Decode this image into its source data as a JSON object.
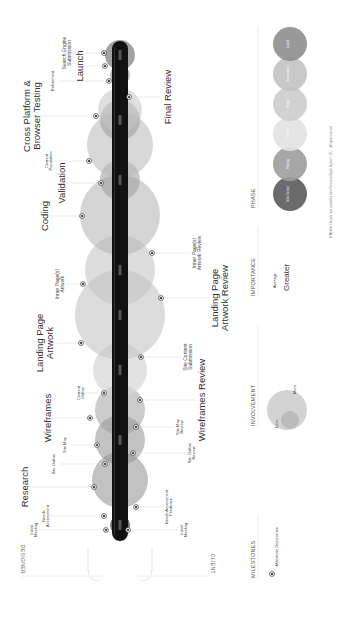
{
  "diagram": {
    "roles": {
      "designer": "DESIGNER",
      "client": "CLIENT"
    },
    "phase_nodes": [
      {
        "id": "initial-contact",
        "cx": 101,
        "r": 10,
        "color": "#5a5a5a",
        "opacity": 0.85
      },
      {
        "id": "research",
        "cx": 146,
        "r": 28,
        "color": "#8f8f8f",
        "opacity": 0.55
      },
      {
        "id": "site-structure",
        "cx": 186,
        "r": 25,
        "color": "#8f8f8f",
        "opacity": 0.55
      },
      {
        "id": "wireframes",
        "cx": 216,
        "r": 25,
        "color": "#9a9a9a",
        "opacity": 0.5
      },
      {
        "id": "content-outline",
        "cx": 256,
        "r": 27,
        "color": "#d6d6d6",
        "opacity": 0.7
      },
      {
        "id": "landing-page-artwork",
        "cx": 311,
        "r": 45,
        "color": "#c4c4c4",
        "opacity": 0.6
      },
      {
        "id": "inner-pages",
        "cx": 356,
        "r": 35,
        "color": "#c4c4c4",
        "opacity": 0.6
      },
      {
        "id": "coding",
        "cx": 411,
        "r": 40,
        "color": "#b8b8b8",
        "opacity": 0.6
      },
      {
        "id": "validation",
        "cx": 446,
        "r": 20,
        "color": "#9a9a9a",
        "opacity": 0.55
      },
      {
        "id": "content-population",
        "cx": 481,
        "r": 33,
        "color": "#bdbdbd",
        "opacity": 0.6
      },
      {
        "id": "cross-platform",
        "cx": 506,
        "r": 20,
        "color": "#9a9a9a",
        "opacity": 0.55
      },
      {
        "id": "final-review",
        "cx": 516,
        "r": 22,
        "color": "#c4c4c4",
        "opacity": 0.55
      },
      {
        "id": "refinement",
        "cx": 551,
        "r": 10,
        "color": "#8a8a8a",
        "opacity": 0.6
      },
      {
        "id": "launch",
        "cx": 571,
        "r": 15,
        "color": "#7a7a7a",
        "opacity": 0.7
      }
    ],
    "bar": {
      "x1": 85,
      "x2": 585,
      "color": "#111111",
      "ticks": [
        "",
        "",
        "",
        "",
        "",
        "",
        ""
      ]
    },
    "designer_milestones": [
      {
        "label": "Initial Meeting",
        "size": "small",
        "dot_x": 96,
        "dot_y": 106,
        "lx": 96,
        "ly": 30
      },
      {
        "label": "Needs Assessment",
        "size": "small",
        "dot_x": 110,
        "dot_y": 104,
        "lx": 110,
        "ly": 42
      },
      {
        "label": "Research",
        "size": "big",
        "dot_x": 139,
        "dot_y": 94,
        "lx": 139,
        "ly": 20
      },
      {
        "label": "Site Outline",
        "size": "small",
        "dot_x": 162,
        "dot_y": 105,
        "lx": 162,
        "ly": 52
      },
      {
        "label": "Site Map",
        "size": "small",
        "dot_x": 181,
        "dot_y": 97,
        "lx": 181,
        "ly": 63
      },
      {
        "label": "Wireframes",
        "size": "big",
        "dot_x": 208,
        "dot_y": 90,
        "lx": 208,
        "ly": 43
      },
      {
        "label": "Content Outline",
        "size": "small",
        "dot_x": 233,
        "dot_y": 104,
        "lx": 233,
        "ly": 77
      },
      {
        "label": "Landing Page Artwork",
        "size": "big",
        "dot_x": 283,
        "dot_y": 81,
        "lx": 283,
        "ly": 35
      },
      {
        "label": "Inner Page(s) Artwork",
        "size": "mid",
        "dot_x": 342,
        "dot_y": 83,
        "lx": 342,
        "ly": 55
      },
      {
        "label": "Coding",
        "size": "big",
        "dot_x": 410,
        "dot_y": 82,
        "lx": 410,
        "ly": 40
      },
      {
        "label": "Validation",
        "size": "big",
        "dot_x": 443,
        "dot_y": 101,
        "lx": 443,
        "ly": 57
      },
      {
        "label": "Content Population",
        "size": "small",
        "dot_x": 465,
        "dot_y": 89,
        "lx": 465,
        "ly": 45
      },
      {
        "label": "Cross Platform & Browser Testing",
        "size": "big",
        "dot_x": 510,
        "dot_y": 96,
        "lx": 510,
        "ly": 22
      },
      {
        "label": "Refinement",
        "size": "small",
        "dot_x": 545,
        "dot_y": 109,
        "lx": 545,
        "ly": 51
      },
      {
        "label": "Launch",
        "size": "big",
        "dot_x": 560,
        "dot_y": 105,
        "lx": 560,
        "ly": 75
      },
      {
        "label": "Search Engine Submission",
        "size": "mid",
        "dot_x": 573,
        "dot_y": 104,
        "lx": 573,
        "ly": 62
      }
    ],
    "client_milestones": [
      {
        "label": "Initial Meeting",
        "size": "small",
        "dot_x": 96,
        "dot_y": 128,
        "lx": 96,
        "ly": 180
      },
      {
        "label": "Needs Assessment Feedback",
        "size": "small",
        "dot_x": 119,
        "dot_y": 136,
        "lx": 119,
        "ly": 165
      },
      {
        "label": "Site Outline Review",
        "size": "small",
        "dot_x": 173,
        "dot_y": 133,
        "lx": 173,
        "ly": 188
      },
      {
        "label": "Site Map Review",
        "size": "small",
        "dot_x": 199,
        "dot_y": 136,
        "lx": 199,
        "ly": 176
      },
      {
        "label": "Wireframes Review",
        "size": "big",
        "dot_x": 226,
        "dot_y": 140,
        "lx": 226,
        "ly": 197
      },
      {
        "label": "Site Content Submission",
        "size": "mid",
        "dot_x": 269,
        "dot_y": 141,
        "lx": 269,
        "ly": 183
      },
      {
        "label": "Landing Page Artwork Review",
        "size": "big",
        "dot_x": 328,
        "dot_y": 161,
        "lx": 328,
        "ly": 210
      },
      {
        "label": "Inner Page(s) Artwork Review",
        "size": "mid",
        "dot_x": 373,
        "dot_y": 152,
        "lx": 373,
        "ly": 192
      },
      {
        "label": "Final Review",
        "size": "big",
        "dot_x": 529,
        "dot_y": 129,
        "lx": 529,
        "ly": 163
      }
    ]
  },
  "legend": {
    "milestones": {
      "title": "MILESTONES",
      "item": "Milestone Occurrence"
    },
    "involvement": {
      "title": "INVOLVEMENT",
      "less": "Less",
      "more": "More"
    },
    "importance": {
      "title": "IMPORTANCE",
      "average": "Average",
      "greater": "Greater"
    },
    "phase": {
      "title": "PHASE",
      "items": [
        {
          "label": "Initial Contact",
          "color": "#5b5b5b"
        },
        {
          "label": "Planning",
          "color": "#9d9d9d"
        },
        {
          "label": "Content",
          "color": "#e2e2e2"
        },
        {
          "label": "Design",
          "color": "#cdcdcd"
        },
        {
          "label": "Development",
          "color": "#c2c2c2"
        },
        {
          "label": "Launch",
          "color": "#8e8e8e"
        }
      ]
    }
  },
  "footer": "A 'Website' Lifecycle' was created by John Furness at Simple Square © 2011 – All rights reserved."
}
